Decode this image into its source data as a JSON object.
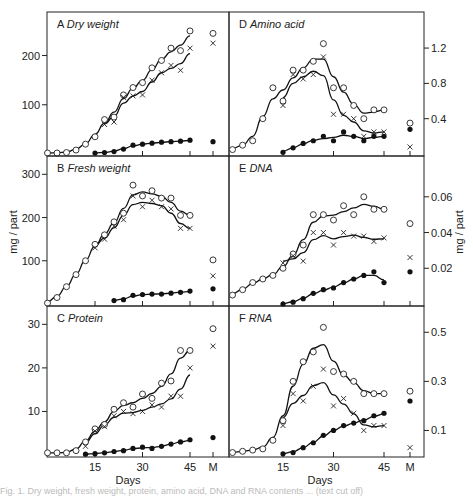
{
  "figure": {
    "y_label_left": "mg / part",
    "y_label_right": "mg / part",
    "x_label": "Days",
    "x_ticks": [
      "15",
      "30",
      "45",
      "M"
    ],
    "caption_partial": "Fig. 1. Dry weight, fresh weight, protein, amino acid, DNA and RNA contents ... (text cut off)"
  },
  "legend_markers": {
    "open_circle": "series 1 (total)",
    "cross": "series 2",
    "filled_circle": "series 3"
  },
  "chart_data": [
    {
      "type": "scatter",
      "panel": "A",
      "title": "Dry weight",
      "xlabel": "",
      "ylabel": "mg / part",
      "yticks": [
        100,
        200
      ],
      "ylim": [
        0,
        260
      ],
      "xlim": [
        0,
        48
      ],
      "series": [
        {
          "name": "open",
          "x": [
            0,
            3,
            6,
            9,
            12,
            15,
            18,
            21,
            24,
            27,
            30,
            33,
            36,
            39,
            42,
            45
          ],
          "values": [
            2,
            2,
            3,
            8,
            20,
            35,
            70,
            75,
            120,
            135,
            145,
            175,
            190,
            215,
            210,
            250
          ],
          "M": 245
        },
        {
          "name": "cross",
          "x": [
            18,
            21,
            24,
            27,
            30,
            33,
            36,
            39,
            42,
            45
          ],
          "values": [
            60,
            65,
            115,
            118,
            120,
            150,
            165,
            180,
            170,
            215
          ],
          "M": 225
        },
        {
          "name": "filled",
          "x": [
            15,
            18,
            21,
            24,
            27,
            30,
            33,
            36,
            39,
            42,
            45
          ],
          "values": [
            2,
            3,
            5,
            10,
            18,
            20,
            22,
            24,
            25,
            26,
            28
          ],
          "M": 25
        }
      ]
    },
    {
      "type": "scatter",
      "panel": "B",
      "title": "Fresh weight",
      "xlabel": "",
      "ylabel": "mg / part",
      "yticks": [
        100,
        200,
        300
      ],
      "ylim": [
        0,
        310
      ],
      "xlim": [
        0,
        48
      ],
      "series": [
        {
          "name": "open",
          "x": [
            0,
            3,
            6,
            9,
            12,
            15,
            18,
            21,
            24,
            27,
            30,
            33,
            36,
            39,
            42,
            45
          ],
          "values": [
            2,
            15,
            40,
            68,
            100,
            138,
            160,
            190,
            210,
            275,
            250,
            262,
            245,
            245,
            205,
            205
          ],
          "M": 102
        },
        {
          "name": "cross",
          "x": [
            15,
            18,
            21,
            24,
            27,
            30,
            33,
            36,
            39,
            42,
            45
          ],
          "values": [
            130,
            150,
            180,
            195,
            250,
            225,
            240,
            225,
            220,
            175,
            175
          ],
          "M": 65
        },
        {
          "name": "filled",
          "x": [
            21,
            24,
            27,
            30,
            33,
            36,
            39,
            42,
            45
          ],
          "values": [
            8,
            10,
            20,
            22,
            23,
            23,
            25,
            27,
            30
          ],
          "M": 35
        }
      ]
    },
    {
      "type": "scatter",
      "panel": "C",
      "title": "Protein",
      "xlabel": "Days",
      "ylabel": "mg / part",
      "yticks": [
        10,
        20,
        30
      ],
      "ylim": [
        0,
        31
      ],
      "xlim": [
        0,
        48
      ],
      "series": [
        {
          "name": "open",
          "x": [
            0,
            3,
            6,
            9,
            12,
            15,
            18,
            21,
            24,
            27,
            30,
            33,
            36,
            39,
            42,
            45
          ],
          "values": [
            0.5,
            0.5,
            0.5,
            1,
            3,
            6,
            7,
            10.5,
            12,
            11,
            14,
            13,
            16.5,
            17,
            24,
            24
          ],
          "M": 29
        },
        {
          "name": "cross",
          "x": [
            12,
            15,
            18,
            21,
            24,
            27,
            30,
            33,
            36,
            39,
            42,
            45
          ],
          "values": [
            2,
            5.5,
            6.5,
            9,
            10,
            9.5,
            10,
            11.5,
            11,
            13.5,
            13.5,
            20
          ],
          "M": 25
        },
        {
          "name": "filled",
          "x": [
            12,
            15,
            18,
            21,
            24,
            27,
            30,
            33,
            36,
            39,
            42,
            45
          ],
          "values": [
            0.2,
            0.3,
            0.5,
            0.8,
            1,
            1.5,
            1.8,
            1.5,
            2,
            2.5,
            3,
            3.5
          ],
          "M": 4
        }
      ]
    },
    {
      "type": "scatter",
      "panel": "D",
      "title": "Amino acid",
      "xlabel": "",
      "ylabel": "mg / part",
      "yticks": [
        0.4,
        0.8,
        1.2
      ],
      "ylim": [
        0,
        1.45
      ],
      "xlim": [
        0,
        48
      ],
      "series": [
        {
          "name": "open",
          "x": [
            0,
            3,
            6,
            9,
            12,
            15,
            18,
            21,
            24,
            27,
            30,
            33,
            36,
            39,
            42,
            45
          ],
          "values": [
            0.05,
            0.1,
            0.15,
            0.4,
            0.75,
            0.6,
            0.95,
            0.95,
            1.05,
            1.25,
            0.75,
            0.75,
            0.55,
            0.4,
            0.5,
            0.5
          ],
          "M": 0.35
        },
        {
          "name": "cross",
          "x": [
            15,
            18,
            21,
            24,
            27,
            30,
            33,
            36,
            39,
            42,
            45
          ],
          "values": [
            0.55,
            0.9,
            0.85,
            0.9,
            1.1,
            0.45,
            0.45,
            0.4,
            0.2,
            0.25,
            0.25
          ],
          "M": 0.08
        },
        {
          "name": "filled",
          "x": [
            15,
            18,
            21,
            24,
            27,
            30,
            33,
            36,
            39,
            42,
            45
          ],
          "values": [
            0.02,
            0.07,
            0.12,
            0.15,
            0.2,
            0.15,
            0.25,
            0.2,
            0.15,
            0.2,
            0.2
          ],
          "M": 0.28
        }
      ]
    },
    {
      "type": "scatter",
      "panel": "E",
      "title": "DNA",
      "xlabel": "",
      "ylabel": "mg / part",
      "yticks": [
        0.02,
        0.04,
        0.06
      ],
      "ylim": [
        0,
        0.075
      ],
      "xlim": [
        0,
        48
      ],
      "series": [
        {
          "name": "open",
          "x": [
            0,
            3,
            6,
            9,
            12,
            15,
            18,
            21,
            24,
            27,
            30,
            33,
            36,
            39,
            42,
            45
          ],
          "values": [
            0.005,
            0.008,
            0.012,
            0.014,
            0.016,
            0.02,
            0.028,
            0.033,
            0.05,
            0.05,
            0.047,
            0.055,
            0.05,
            0.06,
            0.053,
            0.053
          ],
          "M": 0.045
        },
        {
          "name": "cross",
          "x": [
            15,
            18,
            21,
            24,
            27,
            30,
            33,
            36,
            39,
            42,
            45
          ],
          "values": [
            0.023,
            0.027,
            0.024,
            0.04,
            0.04,
            0.033,
            0.04,
            0.038,
            0.038,
            0.035,
            0.037
          ],
          "M": 0.026
        },
        {
          "name": "filled",
          "x": [
            15,
            18,
            21,
            24,
            27,
            30,
            33,
            36,
            39,
            42,
            45
          ],
          "values": [
            0,
            0.001,
            0.003,
            0.006,
            0.008,
            0.009,
            0.012,
            0.014,
            0.016,
            0.018,
            0.012
          ],
          "M": 0.018
        }
      ]
    },
    {
      "type": "scatter",
      "panel": "F",
      "title": "RNA",
      "xlabel": "Days",
      "ylabel": "mg / part",
      "yticks": [
        0.1,
        0.3,
        0.5
      ],
      "ylim": [
        0,
        0.55
      ],
      "xlim": [
        0,
        48
      ],
      "series": [
        {
          "name": "open",
          "x": [
            0,
            3,
            6,
            9,
            12,
            15,
            18,
            21,
            24,
            27,
            30,
            33,
            36,
            39,
            42,
            45
          ],
          "values": [
            0.01,
            0.015,
            0.02,
            0.025,
            0.06,
            0.14,
            0.3,
            0.38,
            0.42,
            0.52,
            0.34,
            0.33,
            0.3,
            0.25,
            0.25,
            0.25
          ],
          "M": 0.26
        },
        {
          "name": "cross",
          "x": [
            15,
            18,
            21,
            24,
            27,
            30,
            33,
            36,
            39,
            42,
            45
          ],
          "values": [
            0.12,
            0.25,
            0.22,
            0.28,
            0.35,
            0.2,
            0.23,
            0.17,
            0.1,
            0.12,
            0.12
          ],
          "M": 0.03
        },
        {
          "name": "filled",
          "x": [
            15,
            18,
            21,
            24,
            27,
            30,
            33,
            36,
            39,
            42,
            45
          ],
          "values": [
            0.005,
            0.01,
            0.03,
            0.05,
            0.08,
            0.1,
            0.12,
            0.13,
            0.14,
            0.16,
            0.17
          ],
          "M": 0.22
        }
      ]
    }
  ]
}
